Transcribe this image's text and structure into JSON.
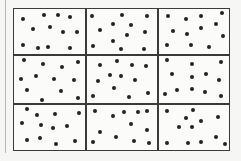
{
  "diagram": {
    "type": "quadrat-grid",
    "rows": 3,
    "cols": 3,
    "colors": {
      "line": "#3a3a3a",
      "dot": "#222222",
      "background": "#f6f6f4"
    },
    "grid_box": {
      "left": 13,
      "top": 8,
      "right": 230,
      "bottom": 151
    },
    "vertical_dividers": [
      86,
      158
    ],
    "horizontal_dividers": [
      55,
      104
    ],
    "cells": [
      {
        "row": 0,
        "col": 0,
        "count": 12,
        "dots": [
          [
            23,
            19
          ],
          [
            44,
            15
          ],
          [
            58,
            15
          ],
          [
            70,
            17
          ],
          [
            33,
            29
          ],
          [
            50,
            27
          ],
          [
            63,
            32
          ],
          [
            77,
            32
          ],
          [
            23,
            45
          ],
          [
            38,
            48
          ],
          [
            48,
            47
          ],
          [
            70,
            48
          ]
        ]
      },
      {
        "row": 0,
        "col": 1,
        "count": 12,
        "dots": [
          [
            92,
            16
          ],
          [
            122,
            15
          ],
          [
            147,
            16
          ],
          [
            100,
            30
          ],
          [
            113,
            24
          ],
          [
            131,
            25
          ],
          [
            127,
            35
          ],
          [
            145,
            32
          ],
          [
            113,
            41
          ],
          [
            93,
            46
          ],
          [
            121,
            49
          ],
          [
            144,
            49
          ]
        ]
      },
      {
        "row": 0,
        "col": 2,
        "count": 12,
        "dots": [
          [
            168,
            16
          ],
          [
            186,
            19
          ],
          [
            201,
            16
          ],
          [
            222,
            13
          ],
          [
            173,
            31
          ],
          [
            187,
            34
          ],
          [
            201,
            28
          ],
          [
            216,
            24
          ],
          [
            223,
            36
          ],
          [
            167,
            45
          ],
          [
            191,
            45
          ],
          [
            209,
            47
          ]
        ]
      },
      {
        "row": 1,
        "col": 0,
        "count": 12,
        "dots": [
          [
            24,
            60
          ],
          [
            43,
            64
          ],
          [
            62,
            67
          ],
          [
            78,
            62
          ],
          [
            21,
            79
          ],
          [
            36,
            76
          ],
          [
            54,
            79
          ],
          [
            74,
            80
          ],
          [
            27,
            90
          ],
          [
            61,
            91
          ],
          [
            42,
            100
          ],
          [
            78,
            98
          ]
        ]
      },
      {
        "row": 1,
        "col": 1,
        "count": 12,
        "dots": [
          [
            100,
            65
          ],
          [
            117,
            61
          ],
          [
            132,
            65
          ],
          [
            146,
            66
          ],
          [
            110,
            75
          ],
          [
            121,
            76
          ],
          [
            98,
            81
          ],
          [
            135,
            80
          ],
          [
            114,
            88
          ],
          [
            93,
            96
          ],
          [
            129,
            97
          ],
          [
            148,
            93
          ]
        ]
      },
      {
        "row": 1,
        "col": 2,
        "count": 12,
        "dots": [
          [
            167,
            60
          ],
          [
            192,
            64
          ],
          [
            221,
            62
          ],
          [
            172,
            74
          ],
          [
            192,
            77
          ],
          [
            206,
            74
          ],
          [
            219,
            80
          ],
          [
            165,
            94
          ],
          [
            177,
            90
          ],
          [
            192,
            89
          ],
          [
            205,
            92
          ],
          [
            221,
            96
          ]
        ]
      },
      {
        "row": 2,
        "col": 0,
        "count": 12,
        "dots": [
          [
            27,
            109
          ],
          [
            37,
            115
          ],
          [
            55,
            114
          ],
          [
            79,
            113
          ],
          [
            22,
            123
          ],
          [
            41,
            125
          ],
          [
            53,
            128
          ],
          [
            67,
            126
          ],
          [
            27,
            140
          ],
          [
            40,
            138
          ],
          [
            56,
            144
          ],
          [
            75,
            141
          ]
        ]
      },
      {
        "row": 2,
        "col": 1,
        "count": 12,
        "dots": [
          [
            95,
            111
          ],
          [
            113,
            116
          ],
          [
            124,
            112
          ],
          [
            138,
            112
          ],
          [
            147,
            111
          ],
          [
            131,
            124
          ],
          [
            100,
            132
          ],
          [
            116,
            137
          ],
          [
            147,
            130
          ],
          [
            93,
            142
          ],
          [
            134,
            141
          ],
          [
            149,
            143
          ]
        ]
      },
      {
        "row": 2,
        "col": 2,
        "count": 12,
        "dots": [
          [
            167,
            111
          ],
          [
            193,
            110
          ],
          [
            186,
            118
          ],
          [
            201,
            121
          ],
          [
            218,
            117
          ],
          [
            179,
            127
          ],
          [
            192,
            127
          ],
          [
            216,
            137
          ],
          [
            167,
            143
          ],
          [
            188,
            143
          ],
          [
            201,
            142
          ],
          [
            225,
            144
          ]
        ]
      }
    ]
  }
}
